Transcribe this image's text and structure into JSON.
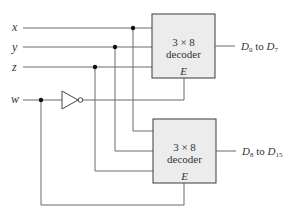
{
  "diagram": {
    "type": "circuit",
    "inputs": [
      {
        "id": "x",
        "label": "x"
      },
      {
        "id": "y",
        "label": "y"
      },
      {
        "id": "z",
        "label": "z"
      },
      {
        "id": "w",
        "label": "w"
      }
    ],
    "decoders": [
      {
        "id": "top",
        "line1": "3 × 8",
        "line2": "decoder",
        "enable": "E",
        "output_main": "D",
        "output_sub_start": "0",
        "output_mid": " to ",
        "output_sub_end": "7",
        "enable_source": "w inverted"
      },
      {
        "id": "bottom",
        "line1": "3 × 8",
        "line2": "decoder",
        "enable": "E",
        "output_main": "D",
        "output_sub_start": "8",
        "output_mid": " to ",
        "output_sub_end": "15",
        "enable_source": "w"
      }
    ],
    "gates": [
      {
        "id": "inverter",
        "type": "NOT",
        "input": "w",
        "output": "top.E"
      }
    ],
    "colors": {
      "wire": "#6b6b6b",
      "box_fill": "#ececec",
      "box_stroke": "#3a3a3a"
    }
  }
}
